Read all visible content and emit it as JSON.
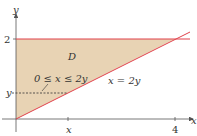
{
  "diagram": {
    "region_label": "D",
    "inequality_label": "0 ≤ x ≤ 2y",
    "line_label": "x = 2y",
    "axes": {
      "x_label": "x",
      "y_label": "y"
    },
    "y_ticks": [
      "2",
      "y"
    ],
    "x_ticks": [
      "x",
      "4"
    ],
    "colors": {
      "fill": "#e8d3b4",
      "boundary": "#e0404a",
      "axis": "#333333"
    }
  }
}
